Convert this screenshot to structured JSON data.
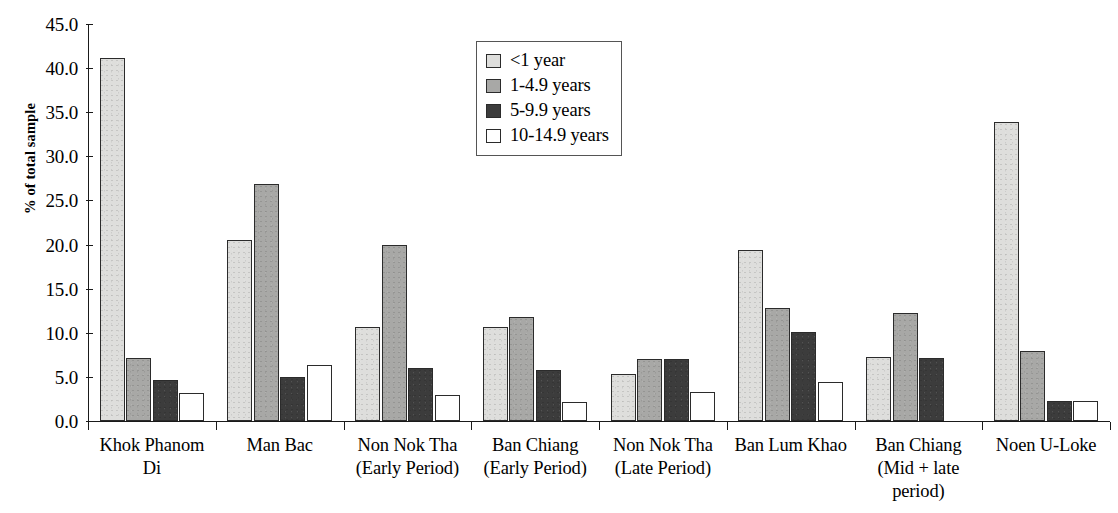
{
  "chart_data": {
    "type": "bar",
    "title": "",
    "xlabel": "",
    "ylabel": "% of total sample",
    "ylim": [
      0,
      45
    ],
    "ytick_step": 5,
    "ytick_labels": [
      "0.0",
      "5.0",
      "10.0",
      "15.0",
      "20.0",
      "25.0",
      "30.0",
      "35.0",
      "40.0",
      "45.0"
    ],
    "grid": false,
    "legend_position": "top-center",
    "categories": [
      "Khok Phanom Di",
      "Man Bac",
      "Non Nok Tha (Early Period)",
      "Ban Chiang (Early Period)",
      "Non Nok Tha (Late Period)",
      "Ban Lum Khao",
      "Ban Chiang (Mid + late period)",
      "Noen U-Loke"
    ],
    "category_label_lines": [
      [
        "Khok Phanom",
        "Di"
      ],
      [
        "Man Bac"
      ],
      [
        "Non Nok Tha",
        "(Early Period)"
      ],
      [
        "Ban Chiang",
        "(Early Period)"
      ],
      [
        "Non Nok Tha",
        "(Late Period)"
      ],
      [
        "Ban Lum Khao"
      ],
      [
        "Ban Chiang",
        "(Mid + late",
        "period)"
      ],
      [
        "Noen U-Loke"
      ]
    ],
    "series": [
      {
        "name": "<1 year",
        "color": "#dededc",
        "values": [
          41.1,
          20.5,
          10.7,
          10.7,
          5.3,
          19.4,
          7.2,
          33.9
        ]
      },
      {
        "name": "1-4.9 years",
        "color": "#a8a8a6",
        "values": [
          7.1,
          26.9,
          20.0,
          11.8,
          7.0,
          12.8,
          12.2,
          7.9
        ]
      },
      {
        "name": "5-9.9 years",
        "color": "#3c3c3c",
        "values": [
          4.6,
          5.0,
          6.0,
          5.8,
          7.0,
          10.1,
          7.1,
          2.3
        ]
      },
      {
        "name": "10-14.9 years",
        "color": "#ffffff",
        "values": [
          3.2,
          6.3,
          3.0,
          2.2,
          3.3,
          4.4,
          null,
          2.3
        ]
      }
    ]
  },
  "legend": {
    "items": [
      {
        "label": "<1 year"
      },
      {
        "label": "1-4.9 years"
      },
      {
        "label": "5-9.9 years"
      },
      {
        "label": "10-14.9 years"
      }
    ]
  },
  "axes": {
    "y_title": "% of total sample"
  }
}
